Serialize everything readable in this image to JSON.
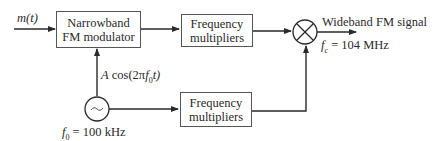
{
  "diagram": {
    "input_signal": "m(t)",
    "blocks": {
      "narrowband_fm": {
        "line1": "Narrowband",
        "line2": "FM modulator"
      },
      "freq_mult_top": {
        "line1": "Frequency",
        "line2": "multipliers"
      },
      "freq_mult_bottom": {
        "line1": "Frequency",
        "line2": "multipliers"
      }
    },
    "mixer_icon": "circled-x-multiplier",
    "oscillator_icon": "sine-oscillator",
    "oscillator_symbol": "~",
    "carrier_expr": {
      "prefix": "A cos(2π",
      "f": "f",
      "sub": "0",
      "suffix": "t)"
    },
    "oscillator_freq": {
      "f": "f",
      "sub": "0",
      "rest": " = 100 kHz"
    },
    "output": {
      "label": "Wideband FM signal",
      "fc": {
        "f": "f",
        "sub": "c",
        "rest": " = 104 MHz"
      }
    },
    "colors": {
      "line": "#2a2a2a",
      "box_border": "#555555",
      "background": "#ffffff"
    }
  }
}
